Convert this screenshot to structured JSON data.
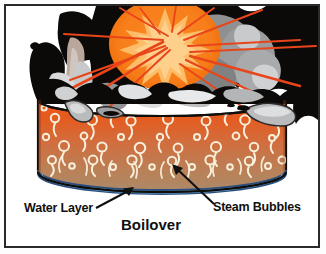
{
  "diagram": {
    "title": "Boilover",
    "caption": "Boilover",
    "labels": {
      "water_layer": "Water Layer",
      "steam_bubbles": "Steam Bubbles",
      "caption": "Boilover"
    },
    "icons": {
      "water_layer_arrow": "arrow-pointer-icon",
      "steam_bubbles_arrow": "arrow-pointer-icon",
      "fireball": "fireball-icon",
      "starburst": "starburst-icon",
      "smoke": "smoke-cloud-icon",
      "tank": "storage-tank-icon",
      "bubble": "steam-bubble-icon",
      "spill": "liquid-spill-icon"
    },
    "colors": {
      "frame_border": "#2c2a28",
      "background": "#ffffff",
      "fireball_outer": "#f4731d",
      "fireball_mid": "#f98a2a",
      "starburst": "#fdb35a",
      "ray": "#e8471c",
      "smoke_dark": "#0d0b0a",
      "smoke_gray": "#8e8f91",
      "smoke_light": "#c9cbcd",
      "tank_top": "#e8531c",
      "tank_mid": "#d4693a",
      "tank_bottom": "#b08a63",
      "bubble": "#f6ecd8",
      "water_layer": "#b9d9ef",
      "water_edge": "#2b4f7e",
      "tank_outline": "#111111",
      "label_text": "#101010"
    },
    "layout": {
      "tank_left": 38,
      "tank_right": 286,
      "tank_top": 92,
      "tank_bottom": 188,
      "water_band_top": 176,
      "grid": "off",
      "legend_position": "none"
    }
  }
}
